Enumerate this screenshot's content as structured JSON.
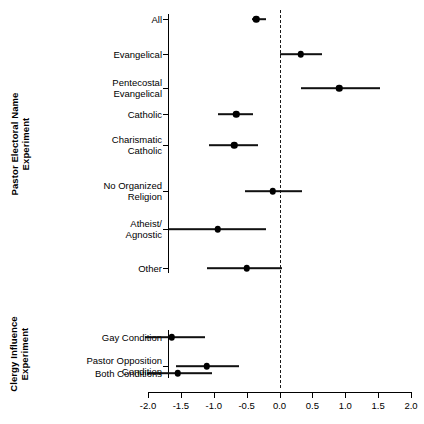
{
  "chart_data": {
    "type": "scatter",
    "subtype": "forest-plot",
    "title": "",
    "xlabel": "",
    "ylabel": "",
    "xlim": [
      -2.0,
      2.0
    ],
    "xticks": [
      -2.0,
      -1.5,
      -1.0,
      -0.5,
      0.0,
      0.5,
      1.0,
      1.5,
      2.0
    ],
    "xtick_labels": [
      "-2.0",
      "-1.5",
      "-1.0",
      "-0.5",
      "0.0",
      "0.5",
      "1.0",
      "1.5",
      "2.0"
    ],
    "grid": false,
    "legend": "none",
    "reference_line": {
      "value": 0.0,
      "style": "dashed",
      "color": "#1a1a1a"
    },
    "point_color": "#000000",
    "line_color": "#111111",
    "groups": [
      {
        "name": "Pastor Electoral Name Experiment",
        "label": "Pastor Electoral Name\nExperiment",
        "rows": [
          {
            "label": "All",
            "estimate": -0.35,
            "ci_low": -1.66,
            "ci_high": -0.21,
            "ci_low_visible": -0.42
          },
          {
            "label": "Evangelical",
            "estimate": 0.32,
            "ci_low": 0.0,
            "ci_high": 0.64
          },
          {
            "label": "Pentecostal\nEvangelical",
            "estimate": 0.91,
            "ci_low": 0.33,
            "ci_high": 1.53
          },
          {
            "label": "Catholic",
            "estimate": -0.66,
            "ci_low": -0.93,
            "ci_high": -0.4
          },
          {
            "label": "Charismatic\nCatholic",
            "estimate": -0.69,
            "ci_low": -1.07,
            "ci_high": -0.33
          },
          {
            "label": "No Organized\nReligion",
            "estimate": -0.1,
            "ci_low": -0.52,
            "ci_high": 0.35
          },
          {
            "label": "Atheist/\nAgnostic",
            "estimate": -0.94,
            "ci_low": -1.68,
            "ci_high": -0.2
          },
          {
            "label": "Other",
            "estimate": -0.5,
            "ci_low": -1.11,
            "ci_high": 0.04
          }
        ]
      },
      {
        "name": "Clergy Influence Experiment",
        "label": "Clergy Influence\nExperiment",
        "rows": [
          {
            "label": "Gay Condition",
            "estimate": -1.64,
            "ci_low": -2.05,
            "ci_high": -1.14
          },
          {
            "label": "Pastor Opposition\nCondition",
            "estimate": -1.11,
            "ci_low": -1.58,
            "ci_high": -0.61
          },
          {
            "label": "Both Conditions",
            "estimate": -1.55,
            "ci_low": -2.02,
            "ci_high": -1.02
          }
        ]
      }
    ]
  },
  "axis": {
    "x_min_label": "-2.0",
    "x_max_label": "2.0"
  }
}
